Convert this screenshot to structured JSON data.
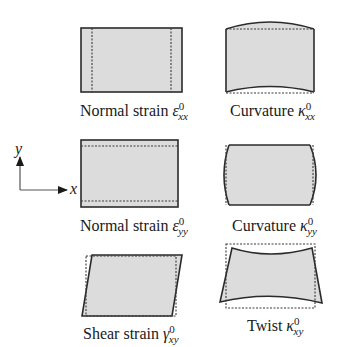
{
  "figure": {
    "axes": {
      "x_label": "x",
      "y_label": "y"
    },
    "colors": {
      "panel_fill": "#dcdcdc",
      "outline": "#2b2b2b",
      "background": "#ffffff"
    },
    "panels": [
      {
        "id": "normal-strain-xx",
        "prefix": "Normal strain ",
        "symbol": "ε",
        "superscript": "0",
        "subscript": "xx"
      },
      {
        "id": "curvature-xx",
        "prefix": "Curvature ",
        "symbol": "κ",
        "superscript": "0",
        "subscript": "xx"
      },
      {
        "id": "normal-strain-yy",
        "prefix": "Normal strain ",
        "symbol": "ε",
        "superscript": "0",
        "subscript": "yy"
      },
      {
        "id": "curvature-yy",
        "prefix": "Curvature ",
        "symbol": "κ",
        "superscript": "0",
        "subscript": "yy"
      },
      {
        "id": "shear-strain-xy",
        "prefix": "Shear strain ",
        "symbol": "γ",
        "superscript": "0",
        "subscript": "xy"
      },
      {
        "id": "twist-xy",
        "prefix": "Twist ",
        "symbol": "κ",
        "superscript": "0",
        "subscript": "xy"
      }
    ]
  }
}
